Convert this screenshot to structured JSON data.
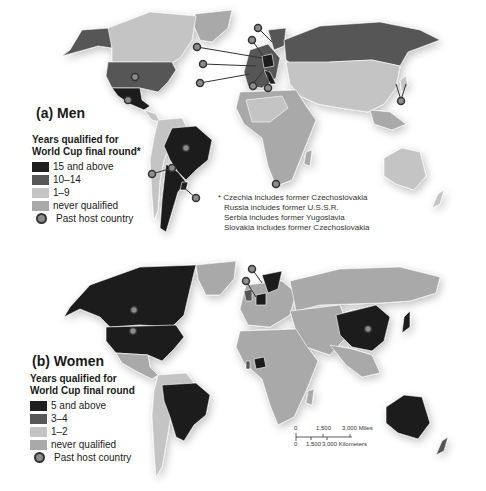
{
  "colors": {
    "level_high": "#1f1f1f",
    "level_mid": "#575757",
    "level_low": "#c4c4c4",
    "never": "#a9a9a9",
    "host_dot": "#8c8c8c",
    "background": "#ffffff"
  },
  "men": {
    "title": "(a) Men",
    "legend": {
      "heading_line1": "Years qualified for",
      "heading_line2": "World Cup final round*",
      "items": [
        {
          "label": "15 and above",
          "color": "#1f1f1f"
        },
        {
          "label": "10–14",
          "color": "#575757"
        },
        {
          "label": "1–9",
          "color": "#c4c4c4"
        },
        {
          "label": "never qualified",
          "color": "#a9a9a9"
        }
      ],
      "host_label": "Past host country"
    },
    "notes": [
      "* Czechia includes former Czechoslovakia",
      "Russia includes former U.S.S.R.",
      "Serbia includes former Yugoslavia",
      "Slovakia includes former Czechoslovakia"
    ]
  },
  "women": {
    "title": "(b) Women",
    "legend": {
      "heading_line1": "Years qualified for",
      "heading_line2": "World Cup final round",
      "items": [
        {
          "label": "5 and above",
          "color": "#1f1f1f"
        },
        {
          "label": "3–4",
          "color": "#575757"
        },
        {
          "label": "1–2",
          "color": "#c4c4c4"
        },
        {
          "label": "never qualified",
          "color": "#a9a9a9"
        }
      ],
      "host_label": "Past host country"
    },
    "scale_bar": {
      "miles_ticks": [
        "0",
        "1,500",
        "3,000 Miles"
      ],
      "km_ticks": [
        "0",
        "1,500",
        "3,000 Kilometers"
      ]
    }
  }
}
